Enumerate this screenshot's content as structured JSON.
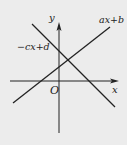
{
  "diagram": {
    "type": "coordinate-plane",
    "axes": {
      "x_label": "x",
      "y_label": "y",
      "origin_label": "O"
    },
    "lines": [
      {
        "name": "ax+b",
        "label": "ax+b",
        "slope_sign": "positive"
      },
      {
        "name": "-cx+d",
        "label": "−cx+d",
        "slope_sign": "negative"
      }
    ],
    "colors": {
      "background": "#ececec",
      "stroke": "#222222"
    }
  }
}
